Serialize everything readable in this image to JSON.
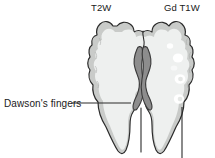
{
  "figure": {
    "type": "medical-illustration",
    "labels": {
      "left_modality": "T2W",
      "right_modality": "Gd T1W",
      "annotation_dawson": "Dawson's fingers"
    },
    "icons": {
      "brain_outline": "brain-axial-outline",
      "ventricles": "lateral-ventricles-shape",
      "lesions": "ring-enhancing-lesion"
    },
    "colors": {
      "background": "#ffffff",
      "brain_interior": "#eef0ef",
      "cortex_band": "#c9cbc9",
      "outline": "#2b2b2b",
      "ventricle_fill": "#8d8d8d",
      "ventricle_outline": "#3a3a3a",
      "lesion_fill": "#ffffff",
      "text": "#1a1a1a",
      "leader_line": "#2b2b2b"
    },
    "lesions": [
      {
        "name": "solid-lesion-upper",
        "cx": 178,
        "cy": 58,
        "r": 5.0,
        "style": "solid"
      },
      {
        "name": "ring-lesion-mid",
        "cx": 180,
        "cy": 79,
        "r": 5.2,
        "style": "ring"
      },
      {
        "name": "ring-lesion-lower",
        "cx": 179,
        "cy": 99,
        "r": 5.0,
        "style": "ring"
      },
      {
        "name": "small-lesion-top",
        "cx": 170,
        "cy": 46,
        "r": 3.0,
        "style": "solid"
      }
    ],
    "leaders": [
      {
        "name": "dawson-leader-line",
        "x1": 72,
        "y1": 103,
        "x2": 131,
        "y2": 103
      },
      {
        "name": "lesion-leader-line",
        "x1": 182,
        "y1": 107,
        "x2": 182,
        "y2": 158
      }
    ]
  }
}
